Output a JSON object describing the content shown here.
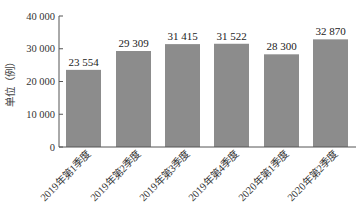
{
  "chart_data": {
    "type": "bar",
    "title": "",
    "xlabel": "",
    "ylabel": "单位（例）",
    "categories": [
      "2019年第1季度",
      "2019年第2季度",
      "2019年第3季度",
      "2019年第4季度",
      "2020年第1季度",
      "2020年第2季度"
    ],
    "values": [
      23554,
      29309,
      31415,
      31522,
      28300,
      32870
    ],
    "value_labels": [
      "23 554",
      "29 309",
      "31 415",
      "31 522",
      "28 300",
      "32 870"
    ],
    "ylim": [
      0,
      40000
    ],
    "yticks": [
      0,
      10000,
      20000,
      30000,
      40000
    ],
    "ytick_labels": [
      "0",
      "10 000",
      "20 000",
      "30 000",
      "40 000"
    ],
    "grid": false,
    "legend": null,
    "bar_color": "#8c8c8c"
  }
}
